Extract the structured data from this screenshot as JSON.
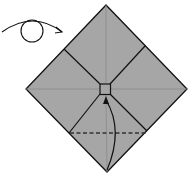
{
  "diagram": {
    "type": "origami-step",
    "colors": {
      "paper": "#a6a6a6",
      "line": "#111111",
      "crease": "#8e8e8e",
      "background": "#ffffff"
    },
    "elements": [
      {
        "name": "turn-over-arrow",
        "meaning": "turn model over"
      },
      {
        "name": "diamond-paper",
        "meaning": "square paper rotated 45 degrees"
      },
      {
        "name": "center-square",
        "meaning": "small square at center"
      },
      {
        "name": "valley-fold-line",
        "meaning": "dashed valley fold"
      },
      {
        "name": "fold-up-arrow",
        "meaning": "fold bottom corner up to center"
      }
    ]
  }
}
